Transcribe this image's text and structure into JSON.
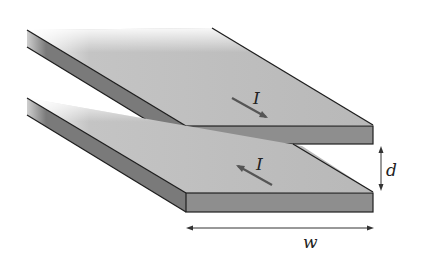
{
  "diagram": {
    "plates": [
      {
        "name": "top-plate",
        "current_label": "I",
        "current_direction": "into-page"
      },
      {
        "name": "bottom-plate",
        "current_label": "I",
        "current_direction": "out-of-page"
      }
    ],
    "separation_label": "d",
    "width_label": "w",
    "colors": {
      "top_surface": "#b9b9b9",
      "side_face": "#7d7d7d",
      "front_face": "#8e8e8e",
      "edge": "#1e1e1e"
    }
  }
}
